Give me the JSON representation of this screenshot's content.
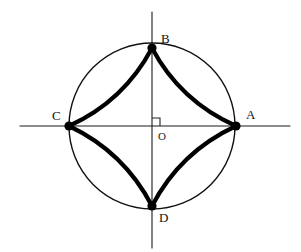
{
  "figure": {
    "canvas": {
      "width": 301,
      "height": 252,
      "background": "#ffffff"
    },
    "stroke_colors": {
      "axis": "#1a1a1a",
      "circle": "#111111",
      "arc": "#000000",
      "vertex_dot": "#000000",
      "right_angle": "#222222",
      "label": "#111111"
    },
    "stroke_widths": {
      "axis": 1.1,
      "circle": 1.4,
      "arc": 4.2,
      "right_angle": 1.1
    },
    "circle": {
      "name": "main-circle",
      "center_x": 152,
      "center_y": 126,
      "radius": 83
    },
    "origin": {
      "name": "O",
      "x": 152,
      "y": 126,
      "label": "O",
      "label_x": 158,
      "label_y": 140
    },
    "right_angle_mark": {
      "name": "right-angle-mark",
      "quadrant": "upper-right",
      "size": 8,
      "x": 152,
      "y": 126
    },
    "axes": [
      {
        "name": "horizontal-axis",
        "x1": 20,
        "y1": 126,
        "x2": 290,
        "y2": 126
      },
      {
        "name": "vertical-axis",
        "x1": 152,
        "y1": 12,
        "x2": 152,
        "y2": 248
      }
    ],
    "vertices": [
      {
        "id": "A",
        "label": "A",
        "x": 236,
        "y": 126,
        "label_x": 246,
        "label_y": 119,
        "dot_r": 4.6
      },
      {
        "id": "B",
        "label": "B",
        "x": 152,
        "y": 48,
        "label_x": 161,
        "label_y": 43,
        "dot_r": 4.6
      },
      {
        "id": "C",
        "label": "C",
        "x": 69,
        "y": 126,
        "label_x": 52,
        "label_y": 120,
        "dot_r": 4.6
      },
      {
        "id": "D",
        "label": "D",
        "x": 152,
        "y": 206,
        "label_x": 159,
        "label_y": 222,
        "dot_r": 4.6
      }
    ],
    "arcs": [
      {
        "id": "arc-CB",
        "from": "C",
        "to": "B",
        "x1": 69,
        "y1": 126,
        "x2": 152,
        "y2": 48,
        "cx": 124,
        "cy": 101,
        "bulge": "toward-center"
      },
      {
        "id": "arc-BA",
        "from": "B",
        "to": "A",
        "x1": 152,
        "y1": 48,
        "x2": 236,
        "y2": 126,
        "cx": 180,
        "cy": 101,
        "bulge": "toward-center"
      },
      {
        "id": "arc-AD",
        "from": "A",
        "to": "D",
        "x1": 236,
        "y1": 126,
        "x2": 152,
        "y2": 206,
        "cx": 180,
        "cy": 152,
        "bulge": "toward-center"
      },
      {
        "id": "arc-DC",
        "from": "D",
        "to": "C",
        "x1": 152,
        "y1": 206,
        "x2": 69,
        "y2": 126,
        "cx": 124,
        "cy": 152,
        "bulge": "toward-center"
      }
    ]
  }
}
